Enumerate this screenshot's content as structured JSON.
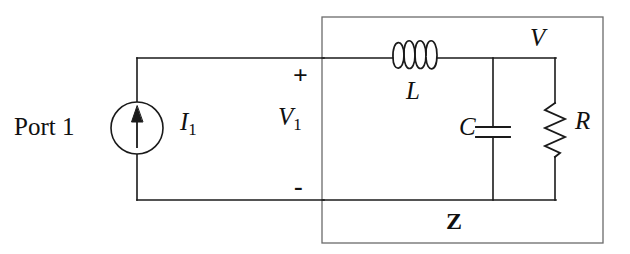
{
  "figure": {
    "type": "circuit-schematic",
    "width": 630,
    "height": 254,
    "background_color": "#ffffff",
    "line_color": "#1a1a1a"
  },
  "labels": {
    "port": "Port 1",
    "source_current": "I",
    "source_current_sub": "1",
    "port_voltage": "V",
    "port_voltage_sub": "1",
    "polarity_plus": "+",
    "polarity_minus": "-",
    "inductor": "L",
    "capacitor": "C",
    "resistor": "R",
    "node_voltage": "V",
    "impedance_block": "Z"
  },
  "components": {
    "current_source": {
      "name": "current-source",
      "symbol": "circle-with-up-arrow",
      "center_x": 137,
      "center_y": 128,
      "radius": 26,
      "arrow_direction": "up"
    },
    "inductor": {
      "name": "inductor",
      "symbol": "coil",
      "loops": 4,
      "x_start": 393,
      "x_end": 437,
      "y": 58
    },
    "capacitor": {
      "name": "capacitor",
      "symbol": "parallel-plates",
      "branch_x": 493,
      "plate_top_y": 127,
      "plate_bottom_y": 137,
      "plate_half_width": 17
    },
    "resistor": {
      "name": "resistor",
      "symbol": "zigzag",
      "branch_x": 555,
      "y_start": 103,
      "y_end": 157,
      "zigs": 6
    },
    "impedance_box": {
      "name": "impedance-box",
      "x": 322,
      "y": 17,
      "width": 281,
      "height": 226
    }
  },
  "wires": {
    "outer_top_y": 58,
    "outer_bottom_y": 200,
    "outer_left_x": 137,
    "inner_right_x": 555,
    "source_top_y": 102,
    "source_bottom_y": 154
  }
}
